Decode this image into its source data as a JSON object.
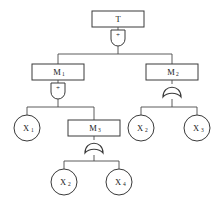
{
  "diagram": {
    "type": "fault-tree",
    "title": "",
    "nodes": [
      {
        "id": "T",
        "label": "T",
        "subscript": "",
        "shape": "rectangle",
        "role": "top-event",
        "x": 118,
        "y": 19,
        "w": 52,
        "h": 16
      },
      {
        "id": "M1",
        "label": "M",
        "subscript": "1",
        "shape": "rectangle",
        "role": "intermediate-event",
        "x": 58,
        "y": 72,
        "w": 52,
        "h": 16
      },
      {
        "id": "M2",
        "label": "M",
        "subscript": "2",
        "shape": "rectangle",
        "role": "intermediate-event",
        "x": 172,
        "y": 72,
        "w": 52,
        "h": 16
      },
      {
        "id": "M3",
        "label": "M",
        "subscript": "3",
        "shape": "rectangle",
        "role": "intermediate-event",
        "x": 94,
        "y": 128,
        "w": 52,
        "h": 16
      },
      {
        "id": "X1",
        "label": "X",
        "subscript": "1",
        "shape": "circle",
        "role": "basic-event",
        "x": 27,
        "y": 128,
        "r": 13
      },
      {
        "id": "X2a",
        "label": "X",
        "subscript": "2",
        "shape": "circle",
        "role": "basic-event",
        "x": 141,
        "y": 128,
        "r": 13
      },
      {
        "id": "X3",
        "label": "X",
        "subscript": "3",
        "shape": "circle",
        "role": "basic-event",
        "x": 197,
        "y": 128,
        "r": 13
      },
      {
        "id": "X2b",
        "label": "X",
        "subscript": "2",
        "shape": "circle",
        "role": "basic-event",
        "x": 64,
        "y": 182,
        "r": 13
      },
      {
        "id": "X4",
        "label": "X",
        "subscript": "4",
        "shape": "circle",
        "role": "basic-event",
        "x": 119,
        "y": 182,
        "r": 13
      }
    ],
    "gates": [
      {
        "id": "G-T",
        "type": "and",
        "symbol": "+",
        "parent": "T",
        "children": [
          "M1",
          "M2"
        ],
        "x": 118,
        "y": 38
      },
      {
        "id": "G-M1",
        "type": "and",
        "symbol": "+",
        "parent": "M1",
        "children": [
          "X1",
          "M3"
        ],
        "x": 58,
        "y": 91
      },
      {
        "id": "G-M2",
        "type": "or",
        "symbol": "",
        "parent": "M2",
        "children": [
          "X2a",
          "X3"
        ],
        "x": 172,
        "y": 91
      },
      {
        "id": "G-M3",
        "type": "or",
        "symbol": "",
        "parent": "M3",
        "children": [
          "X2b",
          "X4"
        ],
        "x": 94,
        "y": 147
      }
    ],
    "colors": {
      "stroke": "#3a3a3a",
      "connector": "#4a4a4a",
      "fill": "#ffffff",
      "text": "#1a1a1a"
    }
  }
}
